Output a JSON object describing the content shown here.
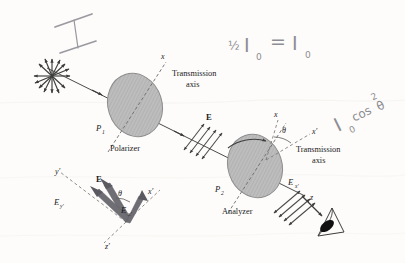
{
  "figure": {
    "background_color": "#fdfcfa",
    "ink_color": "#1a1a1a",
    "pencil_color": "#9a9aa0",
    "disk_color": "#b9b9b9"
  },
  "printed_labels": {
    "polarizer_name": "P",
    "polarizer_sub": "1",
    "polarizer_caption": "Polarizer",
    "analyzer_name": "P",
    "analyzer_sub": "2",
    "analyzer_caption": "Analyzer",
    "transmission_line1": "Transmission",
    "transmission_line2": "axis",
    "transmission2_line1": "Transmission",
    "transmission2_line2": "axis",
    "axis_x_polarizer": "x",
    "axis_x_analyzer": "x",
    "axis_xprime_analyzer": "x′",
    "theta_analyzer": "θ",
    "field_E": "E",
    "field_Exprime": "E",
    "field_Exprime_sub": "x′",
    "axis_z": "z"
  },
  "inset": {
    "axis_yprime": "y′",
    "axis_xprime": "x′",
    "axis_zprime": "z′",
    "vector_E": "E",
    "component_Ey": "E",
    "component_Ey_sub": "y′",
    "component_Ex": "E",
    "component_Ex_sub": "x′",
    "angle_theta": "θ"
  },
  "handwriting": {
    "intensity_I": "I",
    "equation_half": "½",
    "equation_I1": "I",
    "equation_sub1": "0",
    "equation_equals": "=",
    "equation_I2": "I",
    "equation_sub2": "0",
    "malus_I": "I",
    "malus_sub": "0",
    "malus_cos": "cos",
    "malus_exp": "2",
    "malus_theta": "θ"
  },
  "icons": {
    "unpolarized_starburst": "starburst-icon",
    "eye_observer": "eye-icon",
    "rotation_arrow": "rotation-arrow-icon"
  }
}
